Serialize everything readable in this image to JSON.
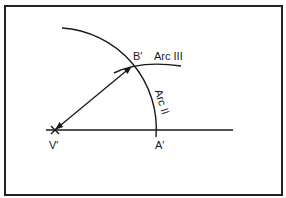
{
  "diagram": {
    "type": "geometric-construction",
    "points": {
      "vertex": {
        "label": "V'",
        "x": 55,
        "y": 130
      },
      "a": {
        "label": "A'",
        "x": 156,
        "y": 130
      },
      "b": {
        "label": "B'",
        "x": 132,
        "y": 66
      }
    },
    "arcs": [
      {
        "label": "Arc II",
        "center": "V'",
        "through": [
          "B'",
          "A'"
        ]
      },
      {
        "label": "Arc III",
        "through": [
          "B'"
        ]
      }
    ],
    "segments": [
      {
        "from": "V'",
        "to": "B'",
        "arrowheads": "both"
      },
      {
        "from": "V'",
        "to": "A'",
        "style": "ray",
        "extends_to_x": 233
      }
    ],
    "colors": {
      "stroke": "#1a1a1a",
      "background": "#ffffff",
      "border": "#222222"
    }
  },
  "labels": {
    "vertex": "V′",
    "point_a": "A′",
    "point_b": "B′",
    "arc_ii": "Arc II",
    "arc_iii": "Arc III"
  }
}
